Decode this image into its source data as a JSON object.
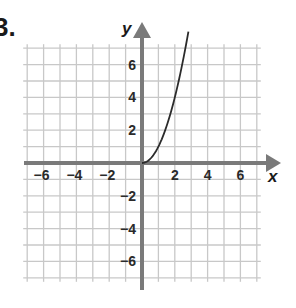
{
  "problem": {
    "label": "3."
  },
  "colors": {
    "grid": "#c8c8c8",
    "axis": "#7a7a7a",
    "curve": "#2b2b2b",
    "text": "#2a2a2a"
  },
  "chart_data": {
    "type": "line",
    "title": "",
    "xlabel": "x",
    "ylabel": "y",
    "xlim": [
      -7,
      7
    ],
    "ylim": [
      -7,
      7
    ],
    "grid": true,
    "grid_step": 1,
    "x_ticks": [
      -6,
      -4,
      -2,
      2,
      4,
      6
    ],
    "y_ticks": [
      6,
      4,
      2,
      -2,
      -4,
      -6
    ],
    "x_tick_labels": [
      "−6",
      "−4",
      "−2",
      "2",
      "4",
      "6"
    ],
    "y_tick_labels": [
      "6",
      "4",
      "2",
      "−2",
      "−4",
      "−6"
    ],
    "series": [
      {
        "name": "curve",
        "description": "half-parabola starting at origin, y = x^2 for x >= 0",
        "x": [
          0,
          0.5,
          1,
          1.5,
          2,
          2.5,
          2.83
        ],
        "y": [
          0,
          0.25,
          1,
          2.25,
          4,
          6.25,
          8
        ]
      }
    ],
    "legend": null
  }
}
